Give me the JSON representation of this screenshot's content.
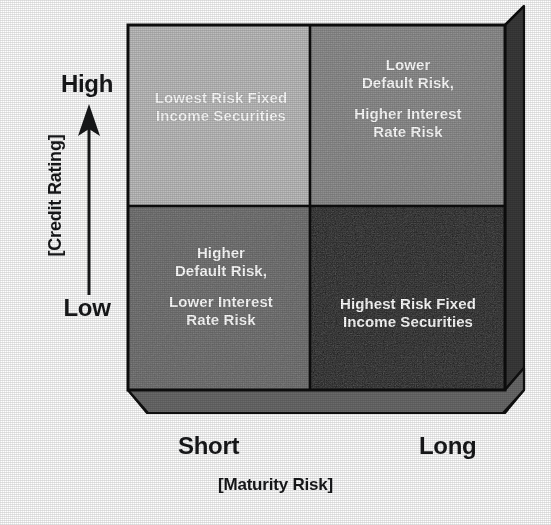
{
  "figure": {
    "type": "2x2-matrix-diagram",
    "title": "",
    "quadrants": [
      {
        "id": "top-left",
        "position": "high-credit-rating-short-maturity",
        "fill": "#bdbdbd",
        "lines": [
          "Lowest Risk Fixed",
          "Income Securities"
        ],
        "line1": "Lowest Risk Fixed",
        "line2": "Income Securities"
      },
      {
        "id": "top-right",
        "position": "high-credit-rating-long-maturity",
        "fill": "#8a8a8a",
        "lines": [
          "Lower",
          "Default Risk,",
          "",
          "Higher Interest",
          "Rate Risk"
        ],
        "line1": "Lower",
        "line2": "Default Risk,",
        "line3": "Higher Interest",
        "line4": "Rate Risk"
      },
      {
        "id": "bottom-left",
        "position": "low-credit-rating-short-maturity",
        "fill": "#6e6e6e",
        "lines": [
          "Higher",
          "Default Risk,",
          "",
          "Lower Interest",
          "Rate Risk"
        ],
        "line1": "Higher",
        "line2": "Default Risk,",
        "line3": "Lower Interest",
        "line4": "Rate Risk"
      },
      {
        "id": "bottom-right",
        "position": "low-credit-rating-long-maturity",
        "fill": "#1a1a1a",
        "lines": [
          "Highest Risk Fixed",
          "Income Securities"
        ],
        "line1": "Highest Risk Fixed",
        "line2": "Income Securities"
      }
    ],
    "y_axis": {
      "title": "[Credit Rating]",
      "high_label": "High",
      "low_label": "Low",
      "arrow": "up-arrow-icon",
      "direction": "low-to-high-upward"
    },
    "x_axis": {
      "title": "[Maturity Risk]",
      "left_label": "Short",
      "right_label": "Long",
      "arrow": "right-arrow-icon",
      "direction": "short-to-long-rightward"
    },
    "colors": {
      "quadrant_lightest": "#bdbdbd",
      "quadrant_light_mid": "#8a8a8a",
      "quadrant_dark_mid": "#6e6e6e",
      "quadrant_darkest": "#1a1a1a",
      "side_panel": "#3a3a3a",
      "bottom_panel": "#6a6a6a",
      "outline": "#111111",
      "quadrant_text": "#ffffff",
      "axis_text": "#17181a",
      "background": "#ffffff"
    },
    "geometry": {
      "front_left": 128,
      "front_right": 505,
      "front_top": 25,
      "front_bottom": 390,
      "depth_x": 19,
      "depth_y": 23,
      "divider_x": 310,
      "divider_y": 206
    }
  }
}
